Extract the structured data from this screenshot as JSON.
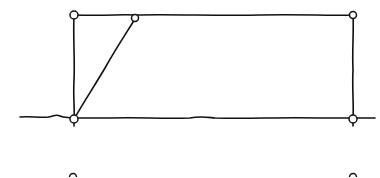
{
  "diagram": {
    "type": "hand-drawn structural frame sketch",
    "width": 380,
    "height": 177,
    "stroke_color": "#111111",
    "background": "#ffffff",
    "ground_line": {
      "path": "M20,117 C30,116 40,118 48,117 C54,116 56,114 60,116 C64,118 68,117 74,118 L110,118 C140,117 160,119 190,118 C200,116 205,117 215,118 C250,119 280,117 320,118 L353,118 L375,118"
    },
    "frame": {
      "top": "M74,15 C110,16 120,14 135,15 C170,14 220,16 260,15 C300,14 330,16 353,15",
      "left": "M74,15 C73,40 75,60 74,80 C73,100 75,110 74,119",
      "right": "M353,15 C354,30 352,50 353,70 C352,90 354,105 353,119",
      "left_post_extension": "M74,119 L74,126",
      "right_post_extension": "M353,119 L353,126"
    },
    "diagonal": {
      "path": "M74,119 C85,100 95,85 105,68 C115,50 125,35 135,19"
    },
    "nodes": [
      {
        "id": "top-left-joint",
        "cx": 74,
        "cy": 15,
        "r": 4
      },
      {
        "id": "top-diagonal-joint",
        "cx": 135,
        "cy": 18,
        "r": 3.5
      },
      {
        "id": "top-right-joint",
        "cx": 353,
        "cy": 15,
        "r": 3.5
      },
      {
        "id": "bottom-left-support",
        "cx": 74,
        "cy": 119,
        "r": 4
      },
      {
        "id": "bottom-right-support",
        "cx": 353,
        "cy": 119,
        "r": 4
      },
      {
        "id": "lower-left-partial-node",
        "cx": 73,
        "cy": 177,
        "r": 3.5
      },
      {
        "id": "lower-right-partial-node",
        "cx": 353,
        "cy": 177,
        "r": 3.5
      }
    ]
  }
}
